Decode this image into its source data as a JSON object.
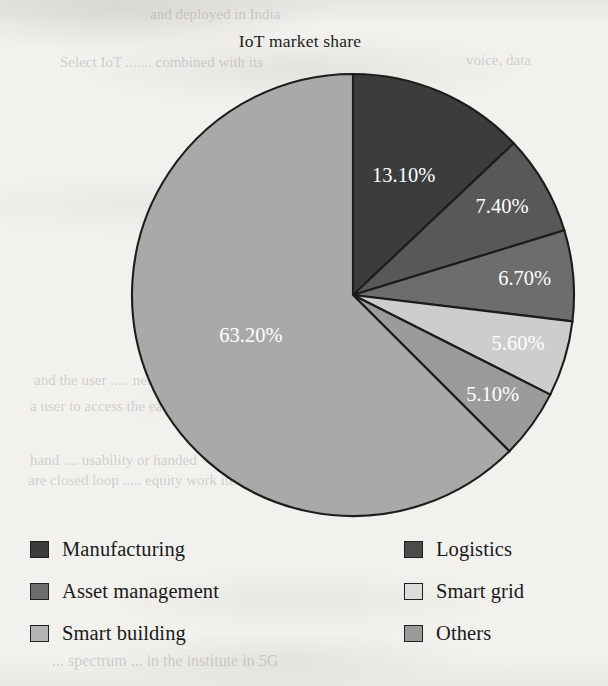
{
  "chart_data": {
    "type": "pie",
    "title": "IoT market share",
    "unit": "percent",
    "start_angle_deg": 0,
    "direction": "clockwise",
    "legend_position": "bottom",
    "categories": [
      "Manufacturing",
      "Logistics",
      "Asset management",
      "Smart grid",
      "Others",
      "Smart building"
    ],
    "values": [
      13.1,
      7.4,
      6.7,
      5.6,
      5.1,
      63.2
    ],
    "labels": [
      "13.10%",
      "7.40%",
      "6.70%",
      "5.60%",
      "5.10%",
      "63.20%"
    ],
    "colors": [
      "#3c3c3c",
      "#585858",
      "#6d6d6d",
      "#cdcdcd",
      "#9b9b9b",
      "#a9a9a9"
    ],
    "slices": [
      {
        "name": "Manufacturing",
        "value": 13.1,
        "label": "13.10%",
        "color": "#3c3c3c"
      },
      {
        "name": "Logistics",
        "value": 7.4,
        "label": "7.40%",
        "color": "#585858"
      },
      {
        "name": "Asset management",
        "value": 6.7,
        "label": "6.70%",
        "color": "#6d6d6d"
      },
      {
        "name": "Smart grid",
        "value": 5.6,
        "label": "5.60%",
        "color": "#cdcdcd"
      },
      {
        "name": "Others",
        "value": 5.1,
        "label": "5.10%",
        "color": "#9b9b9b"
      },
      {
        "name": "Smart building",
        "value": 63.2,
        "label": "63.20%",
        "color": "#a9a9a9"
      }
    ]
  },
  "legend": {
    "columns": 2,
    "entries": [
      {
        "label": "Manufacturing",
        "color": "#3c3c3c"
      },
      {
        "label": "Logistics",
        "color": "#4b4b4b"
      },
      {
        "label": "Asset management",
        "color": "#6d6d6d"
      },
      {
        "label": "Smart grid",
        "color": "#dcdcdc"
      },
      {
        "label": "Smart building",
        "color": "#b4b4b4"
      },
      {
        "label": "Others",
        "color": "#9b9b9b"
      }
    ]
  },
  "page": {
    "background": "#f2f1ee",
    "bleed_through": [
      {
        "text": "and deployed in India",
        "x": 150,
        "y": 6,
        "size": 15
      },
      {
        "text": "Select IoT ....... combined with its",
        "x": 60,
        "y": 54,
        "size": 15
      },
      {
        "text": "voice, data",
        "x": 466,
        "y": 52,
        "size": 15
      },
      {
        "text": "services",
        "x": 232,
        "y": 190,
        "size": 14
      },
      {
        "text": "the six shand",
        "x": 420,
        "y": 220,
        "size": 15
      },
      {
        "text": "and the user ..... network infrastructure",
        "x": 34,
        "y": 372,
        "size": 15
      },
      {
        "text": "a user to access the easy open",
        "x": 30,
        "y": 398,
        "size": 15
      },
      {
        "text": "hand .... usability or handed",
        "x": 30,
        "y": 452,
        "size": 15
      },
      {
        "text": "are closed loop ..... equity work items",
        "x": 28,
        "y": 472,
        "size": 15
      },
      {
        "text": "... spectrum ... in the institute in 5G",
        "x": 52,
        "y": 652,
        "size": 16
      }
    ]
  }
}
